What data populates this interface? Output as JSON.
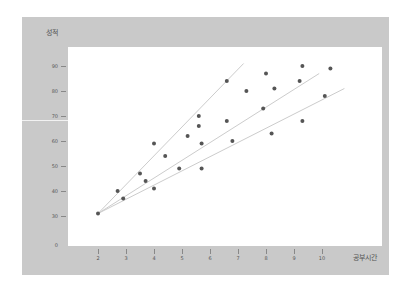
{
  "chart_data": {
    "type": "scatter",
    "title": "",
    "xlabel": "공부시간",
    "ylabel": "성적",
    "x_ticks": [
      "2",
      "3",
      "4",
      "5",
      "6",
      "7",
      "8",
      "9",
      "10"
    ],
    "y_ticks": [
      "0",
      "30",
      "40",
      "50",
      "60",
      "70",
      "80",
      "90"
    ],
    "xlim": [
      1,
      11
    ],
    "ylim": [
      0,
      100
    ],
    "grid": false,
    "points": [
      {
        "x": 2.0,
        "y": 31
      },
      {
        "x": 2.7,
        "y": 40
      },
      {
        "x": 2.9,
        "y": 37
      },
      {
        "x": 3.5,
        "y": 47
      },
      {
        "x": 3.7,
        "y": 44
      },
      {
        "x": 4.0,
        "y": 59
      },
      {
        "x": 4.0,
        "y": 41
      },
      {
        "x": 4.4,
        "y": 54
      },
      {
        "x": 4.9,
        "y": 49
      },
      {
        "x": 5.2,
        "y": 62
      },
      {
        "x": 5.6,
        "y": 70
      },
      {
        "x": 5.6,
        "y": 66
      },
      {
        "x": 5.7,
        "y": 59
      },
      {
        "x": 5.7,
        "y": 49
      },
      {
        "x": 6.6,
        "y": 84
      },
      {
        "x": 6.6,
        "y": 68
      },
      {
        "x": 6.8,
        "y": 60
      },
      {
        "x": 7.3,
        "y": 80
      },
      {
        "x": 8.0,
        "y": 87
      },
      {
        "x": 7.9,
        "y": 73
      },
      {
        "x": 8.3,
        "y": 81
      },
      {
        "x": 8.2,
        "y": 63
      },
      {
        "x": 9.2,
        "y": 84
      },
      {
        "x": 9.3,
        "y": 90
      },
      {
        "x": 9.3,
        "y": 68
      },
      {
        "x": 10.1,
        "y": 78
      },
      {
        "x": 10.3,
        "y": 89
      }
    ],
    "lines": [
      {
        "name": "fit-steep",
        "x1": 2,
        "y1": 31,
        "x2": 7.2,
        "y2": 91
      },
      {
        "name": "fit-middle",
        "x1": 2,
        "y1": 31,
        "x2": 9.9,
        "y2": 87
      },
      {
        "name": "fit-shallow",
        "x1": 2,
        "y1": 31,
        "x2": 10.8,
        "y2": 81
      }
    ],
    "colors": {
      "frame": "#c9c9c9",
      "plot_bg": "#ffffff",
      "point": "#555555",
      "line": "#cccccc"
    }
  },
  "labels": {
    "ylabel": "성적",
    "xlabel": "공부시간"
  }
}
